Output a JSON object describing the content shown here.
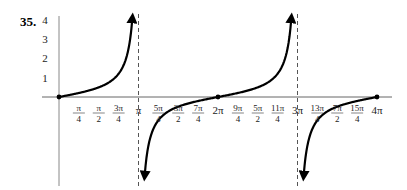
{
  "problem_number": "35.",
  "chart_data": {
    "type": "line",
    "title": "",
    "function": "y = (1/2) tan(x/2)",
    "xlabel": "",
    "ylabel": "",
    "xlim": [
      0,
      12.566
    ],
    "ylim": [
      -4,
      4
    ],
    "grid": false,
    "y_ticks": [
      "1",
      "2",
      "3",
      "4"
    ],
    "x_ticks": [
      {
        "label": "π/4",
        "num": "π",
        "den": "4",
        "value": 0.785
      },
      {
        "label": "π/2",
        "num": "π",
        "den": "2",
        "value": 1.571
      },
      {
        "label": "3π/4",
        "num": "3π",
        "den": "4",
        "value": 2.356
      },
      {
        "label": "π",
        "num": "π",
        "den": "",
        "value": 3.142
      },
      {
        "label": "5π/4",
        "num": "5π",
        "den": "4",
        "value": 3.927
      },
      {
        "label": "3π/2",
        "num": "3π",
        "den": "2",
        "value": 4.712
      },
      {
        "label": "7π/4",
        "num": "7π",
        "den": "4",
        "value": 5.498
      },
      {
        "label": "2π",
        "num": "2π",
        "den": "",
        "value": 6.283
      },
      {
        "label": "9π/4",
        "num": "9π",
        "den": "4",
        "value": 7.069
      },
      {
        "label": "5π/2",
        "num": "5π",
        "den": "2",
        "value": 7.854
      },
      {
        "label": "11π/4",
        "num": "11π",
        "den": "4",
        "value": 8.639
      },
      {
        "label": "3π",
        "num": "3π",
        "den": "",
        "value": 9.425
      },
      {
        "label": "13π/4",
        "num": "13π",
        "den": "4",
        "value": 10.21
      },
      {
        "label": "7π/2",
        "num": "7π",
        "den": "2",
        "value": 10.996
      },
      {
        "label": "15π/4",
        "num": "15π",
        "den": "4",
        "value": 11.781
      },
      {
        "label": "4π",
        "num": "4π",
        "den": "",
        "value": 12.566
      }
    ],
    "asymptotes": [
      3.142,
      9.425
    ],
    "points": [
      {
        "x": 0,
        "y": 0
      },
      {
        "x": 1.571,
        "y": 0.5
      },
      {
        "x": 4.712,
        "y": -0.5
      },
      {
        "x": 6.283,
        "y": 0
      },
      {
        "x": 7.854,
        "y": 0.5
      },
      {
        "x": 10.996,
        "y": -0.5
      },
      {
        "x": 12.566,
        "y": 0
      }
    ],
    "series": [
      {
        "name": "branch-1",
        "x_range": [
          0,
          3.0
        ],
        "description": "rises from (0,0) to +∞ at x=π"
      },
      {
        "name": "branch-2",
        "x_range": [
          3.28,
          9.28
        ],
        "description": "from -∞ after π through (2π,0) to +∞ at 3π"
      },
      {
        "name": "branch-3",
        "x_range": [
          9.57,
          12.566
        ],
        "description": "from -∞ after 3π rising to (4π,0)"
      }
    ]
  }
}
